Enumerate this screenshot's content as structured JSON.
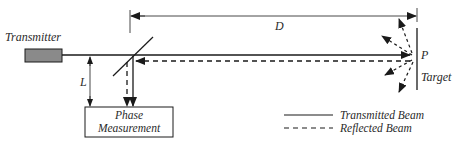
{
  "diagram": {
    "transmitter_label": "Transmitter",
    "distance_label": "D",
    "length_label": "L",
    "point_label": "P",
    "target_label": "Target",
    "phase_box": {
      "line1": "Phase",
      "line2": "Measurement"
    },
    "legend": {
      "transmitted": "Transmitted Beam",
      "reflected": "Reflected Beam"
    },
    "colors": {
      "line": "#1a1a1a",
      "transmitter_fill": "#8a8a8a",
      "text": "#2a2a2a"
    }
  }
}
